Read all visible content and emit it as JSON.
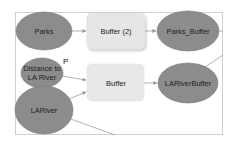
{
  "diagram": {
    "type": "model-builder-workflow",
    "colors": {
      "data_node": "#8c8c8c",
      "data_node_stroke": "#7a7a7a",
      "tool_node": "#e6e6e6",
      "tool_node_stroke": "#dcdcdc",
      "connector": "#a0a0a0",
      "frame": "#d0d0d0"
    },
    "nodes": [
      {
        "id": "parks",
        "kind": "data",
        "shape": "ellipse",
        "label": "Parks"
      },
      {
        "id": "buffer2",
        "kind": "tool",
        "shape": "rounded-rect",
        "label": "Buffer (2)"
      },
      {
        "id": "parks_buffer",
        "kind": "data",
        "shape": "ellipse",
        "label": "Parks_Buffer"
      },
      {
        "id": "distance",
        "kind": "variable",
        "shape": "ellipse",
        "label": "Distance to LA River",
        "badge": "P"
      },
      {
        "id": "buffer",
        "kind": "tool",
        "shape": "rounded-rect",
        "label": "Buffer"
      },
      {
        "id": "lariverbuffer",
        "kind": "data",
        "shape": "ellipse",
        "label": "LARiverBuffer"
      },
      {
        "id": "lariver",
        "kind": "data",
        "shape": "ellipse",
        "label": "LARiver"
      }
    ],
    "edges": [
      {
        "from": "parks",
        "to": "buffer2"
      },
      {
        "from": "buffer2",
        "to": "parks_buffer"
      },
      {
        "from": "parks_buffer",
        "to": "offscreen-right"
      },
      {
        "from": "distance",
        "to": "buffer"
      },
      {
        "from": "lariver",
        "to": "buffer"
      },
      {
        "from": "buffer",
        "to": "lariverbuffer"
      },
      {
        "from": "lariverbuffer",
        "to": "offscreen-top-right"
      },
      {
        "from": "lariver",
        "to": "offscreen-bottom"
      }
    ]
  }
}
